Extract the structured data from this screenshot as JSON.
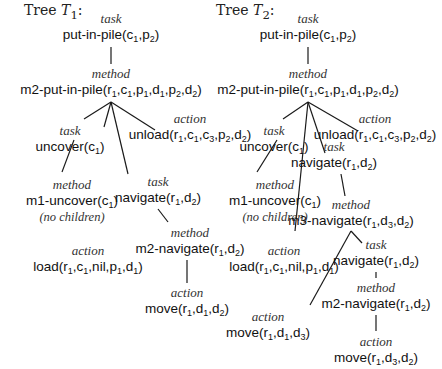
{
  "trees": [
    {
      "title_prefix": "Tree ",
      "title_var": "T",
      "title_sub": "1",
      "title_suffix": ":",
      "nodes": [
        {
          "id": "t1-root",
          "kind": "task",
          "label": "put-in-pile(c1,p2)"
        },
        {
          "id": "t1-m2pip",
          "kind": "method",
          "label": "m2-put-in-pile(r1,c1,p1,d1,p2,d2)"
        },
        {
          "id": "t1-uncover",
          "kind": "task",
          "label": "uncover(c1)"
        },
        {
          "id": "t1-unload",
          "kind": "action",
          "label": "unload(r1,c1,c3,p2,d2)"
        },
        {
          "id": "t1-m1uncover",
          "kind": "method",
          "label": "m1-uncover(c1)",
          "note": "(no children)"
        },
        {
          "id": "t1-navigate",
          "kind": "task",
          "label": "navigate(r1,d2)"
        },
        {
          "id": "t1-m2nav",
          "kind": "method",
          "label": "m2-navigate(r1,d2)"
        },
        {
          "id": "t1-load",
          "kind": "action",
          "label": "load(r1,c1,nil,p1,d1)"
        },
        {
          "id": "t1-move",
          "kind": "action",
          "label": "move(r1,d1,d2)"
        }
      ]
    },
    {
      "title_prefix": "Tree ",
      "title_var": "T",
      "title_sub": "2",
      "title_suffix": ":",
      "nodes": [
        {
          "id": "t2-root",
          "kind": "task",
          "label": "put-in-pile(c1,p2)"
        },
        {
          "id": "t2-m2pip",
          "kind": "method",
          "label": "m2-put-in-pile(r1,c1,p1,d1,p2,d2)"
        },
        {
          "id": "t2-uncover",
          "kind": "task",
          "label": "uncover(c1)"
        },
        {
          "id": "t2-unload",
          "kind": "action",
          "label": "unload(r1,c1,c3,p2,d2)"
        },
        {
          "id": "t2-navigate",
          "kind": "task",
          "label": "navigate(r1,d2)"
        },
        {
          "id": "t2-m1uncover",
          "kind": "method",
          "label": "m1-uncover(c1)",
          "note": "(no children)"
        },
        {
          "id": "t2-m3nav",
          "kind": "method",
          "label": "m3-navigate(r1,d3,d2)"
        },
        {
          "id": "t2-load",
          "kind": "action",
          "label": "load(r1,c1,nil,p1,d1)"
        },
        {
          "id": "t2-navigate2",
          "kind": "task",
          "label": "navigate(r1,d2)"
        },
        {
          "id": "t2-m2nav",
          "kind": "method",
          "label": "m2-navigate(r1,d2)"
        },
        {
          "id": "t2-move1",
          "kind": "action",
          "label": "move(r1,d1,d3)"
        },
        {
          "id": "t2-move2",
          "kind": "action",
          "label": "move(r1,d3,d2)"
        }
      ]
    }
  ],
  "layout": {
    "t1-root": [
      111,
      12
    ],
    "t1-m2pip": [
      111,
      67
    ],
    "t1-uncover": [
      70,
      124
    ],
    "t1-unload": [
      190,
      112
    ],
    "t1-m1uncover": [
      72,
      178
    ],
    "t1-navigate": [
      158,
      175
    ],
    "t1-m2nav": [
      190,
      226
    ],
    "t1-load": [
      88,
      244
    ],
    "t1-move": [
      187,
      286
    ],
    "t2-root": [
      308,
      12
    ],
    "t2-m2pip": [
      308,
      67
    ],
    "t2-uncover": [
      274,
      124
    ],
    "t2-unload": [
      375,
      112
    ],
    "t2-navigate": [
      334,
      140
    ],
    "t2-m1uncover": [
      275,
      178
    ],
    "t2-m3nav": [
      351,
      198
    ],
    "t2-load": [
      284,
      244
    ],
    "t2-navigate2": [
      376,
      238
    ],
    "t2-m2nav": [
      376,
      281
    ],
    "t2-move1": [
      268,
      310
    ],
    "t2-move2": [
      376,
      335
    ]
  },
  "edges": [
    [
      111,
      47,
      111,
      64
    ],
    [
      111,
      102,
      84,
      119
    ],
    [
      111,
      102,
      104,
      127
    ],
    [
      111,
      102,
      128,
      174
    ],
    [
      111,
      102,
      155,
      130
    ],
    [
      74,
      140,
      62,
      172
    ],
    [
      158,
      209,
      168,
      222
    ],
    [
      187,
      260,
      187,
      283
    ],
    [
      308,
      47,
      308,
      64
    ],
    [
      308,
      102,
      283,
      119
    ],
    [
      308,
      102,
      295,
      231
    ],
    [
      308,
      102,
      325,
      153
    ],
    [
      308,
      102,
      358,
      131
    ],
    [
      277,
      140,
      257,
      172
    ],
    [
      341,
      174,
      345,
      196
    ],
    [
      351,
      231,
      310,
      305
    ],
    [
      351,
      231,
      362,
      243
    ],
    [
      376,
      272,
      376,
      278
    ],
    [
      376,
      315,
      376,
      331
    ]
  ],
  "colors": {
    "ink": "#111111",
    "background": "#ffffff"
  }
}
